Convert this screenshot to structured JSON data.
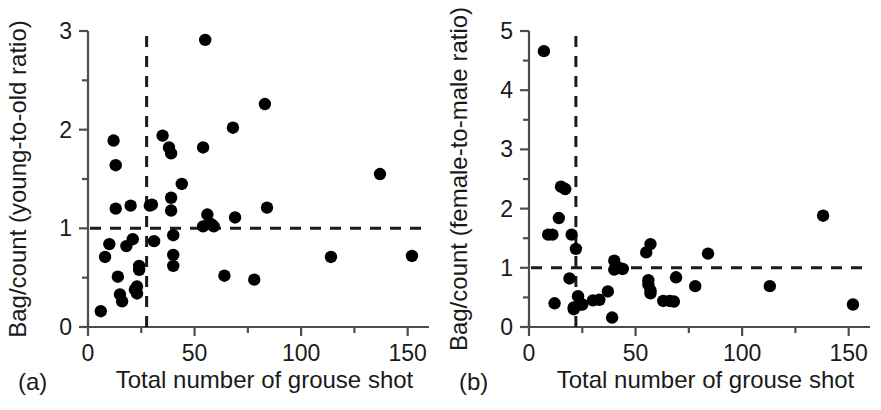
{
  "figure": {
    "background_color": "#ffffff",
    "marker_color": "#000000",
    "axis_color": "#4d4d4d",
    "reference_line_color": "#1a1a1a"
  },
  "chart_data": [
    {
      "type": "scatter",
      "panel_tag": "(a)",
      "title": "",
      "xlabel": "Total number of grouse shot",
      "ylabel": "Bag/count (young-to-old ratio)",
      "xlim": [
        0,
        160
      ],
      "ylim": [
        0,
        3
      ],
      "xticks": [
        0,
        50,
        100,
        150
      ],
      "xtick_labels": [
        "0",
        "50",
        "100",
        "150"
      ],
      "xminorticks": [
        25,
        75,
        125
      ],
      "yticks": [
        0,
        1,
        2,
        3
      ],
      "ytick_labels": [
        "0",
        "1",
        "2",
        "3"
      ],
      "yminorticks": [
        0.5,
        1.5,
        2.5
      ],
      "grid": false,
      "legend": null,
      "reference_lines": [
        {
          "orientation": "horizontal",
          "value": 1.0,
          "style": "dashed"
        },
        {
          "orientation": "vertical",
          "value": 27.5,
          "style": "dashed"
        }
      ],
      "points": [
        [
          6,
          0.16
        ],
        [
          10,
          0.84
        ],
        [
          8,
          0.71
        ],
        [
          12,
          1.89
        ],
        [
          13,
          1.64
        ],
        [
          13,
          1.2
        ],
        [
          14,
          0.51
        ],
        [
          15,
          0.33
        ],
        [
          16,
          0.26
        ],
        [
          18,
          0.82
        ],
        [
          20,
          1.23
        ],
        [
          21,
          0.89
        ],
        [
          22,
          0.38
        ],
        [
          23,
          0.41
        ],
        [
          23,
          0.34
        ],
        [
          24,
          0.62
        ],
        [
          24,
          0.58
        ],
        [
          29,
          1.23
        ],
        [
          30,
          1.24
        ],
        [
          31,
          0.87
        ],
        [
          35,
          1.94
        ],
        [
          38,
          1.82
        ],
        [
          39,
          1.76
        ],
        [
          39,
          1.31
        ],
        [
          39,
          1.18
        ],
        [
          40,
          0.93
        ],
        [
          40,
          0.73
        ],
        [
          40,
          0.62
        ],
        [
          44,
          1.45
        ],
        [
          54,
          1.82
        ],
        [
          54,
          1.02
        ],
        [
          55,
          2.91
        ],
        [
          56,
          1.14
        ],
        [
          57,
          1.05
        ],
        [
          58,
          1.04
        ],
        [
          59,
          1.02
        ],
        [
          64,
          0.52
        ],
        [
          68,
          2.02
        ],
        [
          69,
          1.11
        ],
        [
          78,
          0.48
        ],
        [
          83,
          2.26
        ],
        [
          84,
          1.21
        ],
        [
          114,
          0.71
        ],
        [
          137,
          1.55
        ],
        [
          152,
          0.72
        ]
      ]
    },
    {
      "type": "scatter",
      "panel_tag": "(b)",
      "title": "",
      "xlabel": "Total number of grouse shot",
      "ylabel": "Bag/count (female-to-male ratio)",
      "xlim": [
        0,
        160
      ],
      "ylim": [
        0,
        5
      ],
      "xticks": [
        0,
        50,
        100,
        150
      ],
      "xtick_labels": [
        "0",
        "50",
        "100",
        "150"
      ],
      "xminorticks": [
        25,
        75,
        125
      ],
      "yticks": [
        0,
        1,
        2,
        3,
        4,
        5
      ],
      "ytick_labels": [
        "0",
        "1",
        "2",
        "3",
        "4",
        "5"
      ],
      "yminorticks": [
        0.5,
        1.5,
        2.5,
        3.5,
        4.5
      ],
      "grid": false,
      "legend": null,
      "reference_lines": [
        {
          "orientation": "horizontal",
          "value": 1.0,
          "style": "dashed"
        },
        {
          "orientation": "vertical",
          "value": 22.0,
          "style": "dashed"
        }
      ],
      "points": [
        [
          7,
          4.66
        ],
        [
          9,
          1.56
        ],
        [
          11,
          1.56
        ],
        [
          12,
          0.4
        ],
        [
          14,
          1.84
        ],
        [
          15,
          2.37
        ],
        [
          17,
          2.33
        ],
        [
          19,
          0.82
        ],
        [
          20,
          1.56
        ],
        [
          21,
          0.3
        ],
        [
          21,
          0.33
        ],
        [
          22,
          1.32
        ],
        [
          23,
          0.52
        ],
        [
          24,
          0.38
        ],
        [
          25,
          0.38
        ],
        [
          30,
          0.45
        ],
        [
          33,
          0.46
        ],
        [
          37,
          0.6
        ],
        [
          39,
          0.16
        ],
        [
          40,
          1.12
        ],
        [
          40,
          0.97
        ],
        [
          41,
          1.02
        ],
        [
          43,
          0.99
        ],
        [
          44,
          0.98
        ],
        [
          55,
          1.26
        ],
        [
          56,
          0.79
        ],
        [
          56,
          0.72
        ],
        [
          57,
          1.4
        ],
        [
          57,
          0.62
        ],
        [
          57,
          0.57
        ],
        [
          63,
          0.44
        ],
        [
          66,
          0.44
        ],
        [
          68,
          0.43
        ],
        [
          69,
          0.84
        ],
        [
          78,
          0.69
        ],
        [
          84,
          1.24
        ],
        [
          113,
          0.69
        ],
        [
          138,
          1.88
        ],
        [
          152,
          0.38
        ]
      ]
    }
  ]
}
